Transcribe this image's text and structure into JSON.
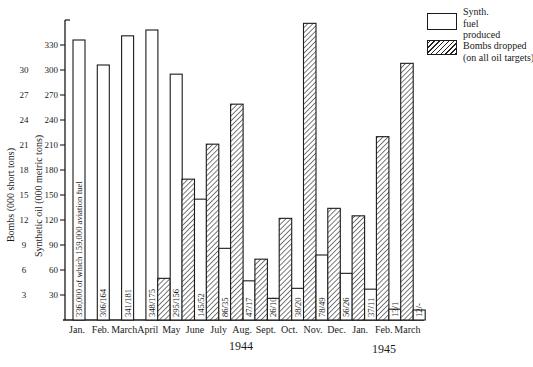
{
  "legend": {
    "items": [
      {
        "key": "synth",
        "lines": [
          "Synth.",
          "fuel",
          "produced"
        ]
      },
      {
        "key": "bombs",
        "lines": [
          "Bombs dropped",
          "(on all oil targets)"
        ]
      }
    ]
  },
  "axes": {
    "left_outer_title": "Bombs (000 short tons)",
    "left_inner_title": "Synthetic oil (000 metric tons)"
  },
  "years": [
    "1944",
    "1945"
  ],
  "chart_data": {
    "type": "bar",
    "title": "",
    "xlabel": "",
    "categories": [
      "Jan.",
      "Feb.",
      "March",
      "April",
      "May",
      "June",
      "July",
      "Aug.",
      "Sept.",
      "Oct.",
      "Nov.",
      "Dec.",
      "Jan.",
      "Feb.",
      "March"
    ],
    "year_groups": [
      {
        "label": "1944",
        "from_index": 0,
        "to_index": 11
      },
      {
        "label": "1945",
        "from_index": 12,
        "to_index": 14
      }
    ],
    "series": [
      {
        "name": "Synth. fuel produced",
        "axis": "Synthetic oil (000 metric tons)",
        "style": "white",
        "values": [
          336,
          306,
          341,
          348,
          295,
          145,
          86,
          47,
          26,
          38,
          78,
          56,
          37,
          13,
          12
        ],
        "aviation_fuel": [
          159,
          164,
          181,
          175,
          156,
          52,
          35,
          17,
          10,
          20,
          49,
          26,
          11,
          1,
          null
        ],
        "bar_labels": [
          "336,000 of which 159,000 aviation fuel",
          "306/164",
          "341/181",
          "348/175",
          "295/156",
          "145/52",
          "86/35",
          "47/17",
          "26/10",
          "38/20",
          "78/49",
          "56/26",
          "37/11",
          "13/1",
          "12/-"
        ]
      },
      {
        "name": "Bombs dropped (on all oil targets)",
        "axis": "Bombs (000 short tons)",
        "style": "hatched",
        "values": [
          null,
          null,
          null,
          null,
          5.0,
          16.9,
          21.1,
          25.9,
          7.3,
          12.2,
          35.6,
          13.4,
          12.5,
          22.0,
          30.8
        ]
      }
    ],
    "y_axis_synth": {
      "label": "Synthetic oil (000 metric tons)",
      "ticks": [
        30,
        60,
        90,
        120,
        150,
        180,
        210,
        240,
        270,
        300,
        330
      ],
      "range": [
        0,
        360
      ]
    },
    "y_axis_bombs": {
      "label": "Bombs (000 short tons)",
      "ticks": [
        3,
        6,
        9,
        12,
        15,
        18,
        21,
        24,
        27,
        30
      ],
      "range": [
        0,
        36
      ]
    },
    "grid": false,
    "legend_position": "top-right"
  }
}
